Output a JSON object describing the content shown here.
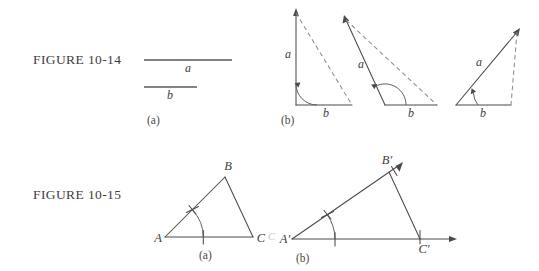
{
  "figures": [
    {
      "id": "figure-10-14",
      "label": "FIGURE 10-14",
      "panels": [
        {
          "key": "a",
          "caption": "(a)",
          "segments": [
            {
              "name": "a",
              "label": "a"
            },
            {
              "name": "b",
              "label": "b"
            }
          ]
        },
        {
          "key": "b",
          "caption": "(b)",
          "triangles": [
            {
              "name": "right-triangle",
              "side_a": "a",
              "side_b": "b",
              "angle_kind": "right"
            },
            {
              "name": "obtuse-triangle",
              "side_a": "a",
              "side_b": "b",
              "angle_kind": "obtuse"
            },
            {
              "name": "acute-triangle",
              "side_a": "a",
              "side_b": "b",
              "angle_kind": "acute"
            }
          ]
        }
      ]
    },
    {
      "id": "figure-10-15",
      "label": "FIGURE 10-15",
      "panels": [
        {
          "key": "a",
          "caption": "(a)",
          "vertices": [
            {
              "name": "A",
              "label": "A"
            },
            {
              "name": "B",
              "label": "B"
            },
            {
              "name": "C",
              "label": "C"
            }
          ]
        },
        {
          "key": "b",
          "caption": "(b)",
          "vertices": [
            {
              "name": "A-prime",
              "label": "A′"
            },
            {
              "name": "B-prime",
              "label": "B′"
            },
            {
              "name": "C-prime",
              "label": "C′"
            }
          ],
          "stray_mark": "C"
        }
      ]
    }
  ],
  "colors": {
    "ink": "#4a4a4a",
    "dashed": "#8c8c8c",
    "background": "#ffffff"
  }
}
